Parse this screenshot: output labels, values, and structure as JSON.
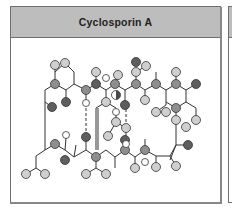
{
  "panel": {
    "title": "Cyclosporin A"
  },
  "colors": {
    "header_bg": "#bdbdbd",
    "border": "#6f6f6f",
    "carbon_light": "#cfcfcf",
    "carbon_mid": "#8e8e8e",
    "oxygen_dark": "#5e5e5e",
    "hydrogen": "#ffffff",
    "bond": "#333333"
  },
  "diagram": {
    "type": "molecular-structure",
    "subject": "Cyclosporin A",
    "atom_legend_shades": [
      "light-gray",
      "mid-gray",
      "dark-gray",
      "white",
      "half-split"
    ]
  }
}
